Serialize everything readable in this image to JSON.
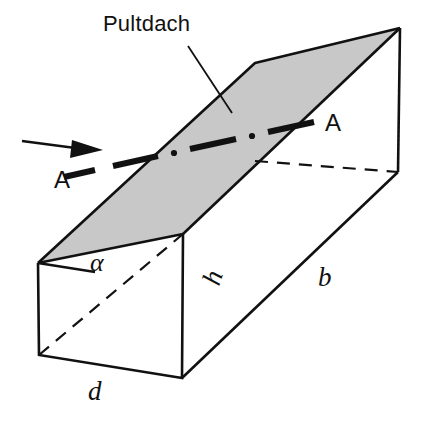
{
  "figure": {
    "title_label": "Pultdach",
    "colors": {
      "roof_fill": "#c8c8c8",
      "stroke": "#111111",
      "background": "#ffffff"
    },
    "labels": {
      "roof": "Pultdach",
      "section_left": "A",
      "section_right": "A",
      "angle": "α",
      "height": "h",
      "length": "b",
      "depth": "d"
    },
    "annotations": [
      {
        "name": "roof-callout",
        "text": "Pultdach"
      },
      {
        "name": "section-mark-left",
        "text": "A"
      },
      {
        "name": "section-mark-right",
        "text": "A"
      },
      {
        "name": "angle-alpha",
        "text": "α"
      },
      {
        "name": "dimension-h",
        "text": "h"
      },
      {
        "name": "dimension-b",
        "text": "b"
      },
      {
        "name": "dimension-d",
        "text": "d"
      }
    ]
  }
}
